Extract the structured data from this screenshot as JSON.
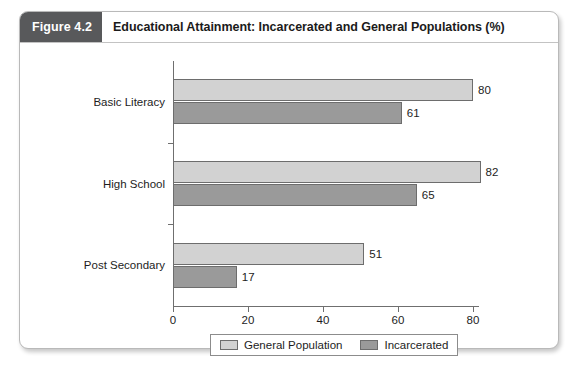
{
  "figure": {
    "badge": "Figure 4.2",
    "title": "Educational Attainment: Incarcerated and General Populations (%)"
  },
  "chart_data": {
    "type": "bar",
    "orientation": "horizontal",
    "title": "Educational Attainment: Incarcerated and General Populations (%)",
    "categories": [
      "Basic Literacy",
      "High School",
      "Post Secondary"
    ],
    "series": [
      {
        "name": "General Population",
        "color": "#d2d2d2",
        "values": [
          80,
          82,
          51
        ]
      },
      {
        "name": "Incarcerated",
        "color": "#9a9a9a",
        "values": [
          61,
          65,
          17
        ]
      }
    ],
    "xlabel": "",
    "ylabel": "",
    "xlim": [
      0,
      80
    ],
    "xticks": [
      0,
      20,
      40,
      60,
      80
    ],
    "xtick_labels": [
      "0",
      "20",
      "40",
      "60",
      "80"
    ],
    "grid": false,
    "legend_position": "bottom",
    "value_labels": true
  }
}
